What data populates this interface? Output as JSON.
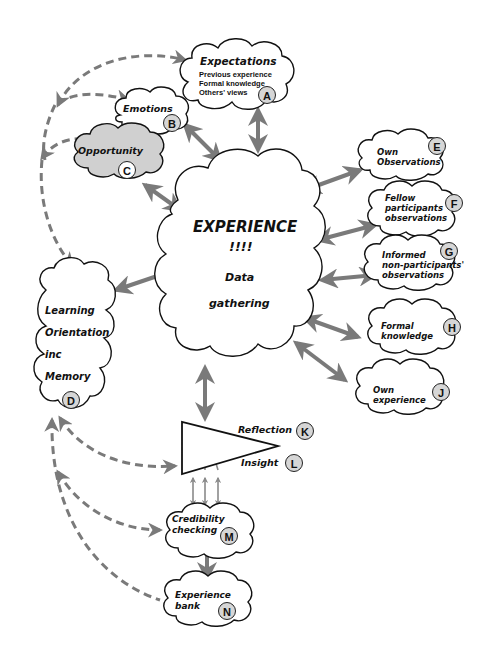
{
  "diagram": {
    "colors": {
      "arrow": "#7a7a7a",
      "cloud_stroke": "#111111",
      "cloud_fill": "#ffffff",
      "opportunity_fill": "#d0d0d0",
      "badge_fill": "#d6d6d6"
    },
    "center": {
      "title": "EXPERIENCE",
      "exclaim": "!!!!",
      "line1": "Data",
      "line2": "gathering"
    },
    "nodes": {
      "A": {
        "label": "Expectations",
        "lines": [
          "Previous experience",
          "Formal knowledge",
          "Others' views"
        ],
        "badge": "A"
      },
      "B": {
        "label": "Emotions",
        "badge": "B"
      },
      "C": {
        "label": "Opportunity",
        "badge": "C"
      },
      "D": {
        "lines": [
          "Learning",
          "Orientation",
          "inc",
          "Memory"
        ],
        "badge": "D"
      },
      "E": {
        "lines": [
          "Own",
          "Observations"
        ],
        "badge": "E"
      },
      "F": {
        "lines": [
          "Fellow",
          "participants",
          "observations"
        ],
        "badge": "F"
      },
      "G": {
        "lines": [
          "Informed",
          "non-participants'",
          "observations"
        ],
        "badge": "G"
      },
      "H": {
        "lines": [
          "Formal",
          "knowledge"
        ],
        "badge": "H"
      },
      "J": {
        "lines": [
          "Own",
          "experience"
        ],
        "badge": "J"
      },
      "K": {
        "label": "Reflection",
        "badge": "K"
      },
      "L": {
        "label": "Insight",
        "badge": "L"
      },
      "M": {
        "lines": [
          "Credibility",
          "checking"
        ],
        "badge": "M"
      },
      "N": {
        "lines": [
          "Experience",
          "bank"
        ],
        "badge": "N"
      }
    }
  }
}
